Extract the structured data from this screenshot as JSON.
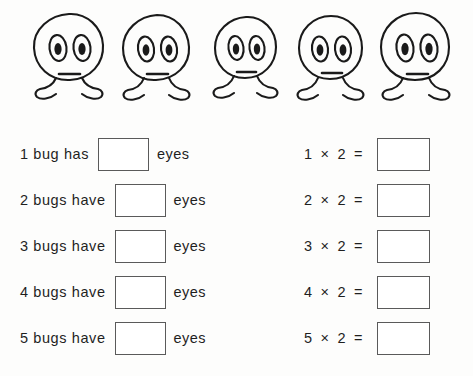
{
  "worksheet": {
    "illustration": {
      "creature_name": "bug",
      "count": 5,
      "eyes_per_creature": 2,
      "bugs": [
        {
          "label": "bug-1"
        },
        {
          "label": "bug-2"
        },
        {
          "label": "bug-3"
        },
        {
          "label": "bug-4"
        },
        {
          "label": "bug-5"
        }
      ]
    },
    "rows": [
      {
        "sentence": "1 bug has",
        "answer": "",
        "unit": "eyes",
        "equation": "1  ×  2  =",
        "equation_answer": ""
      },
      {
        "sentence": "2 bugs have",
        "answer": "",
        "unit": "eyes",
        "equation": "2  ×  2  =",
        "equation_answer": ""
      },
      {
        "sentence": "3 bugs have",
        "answer": "",
        "unit": "eyes",
        "equation": "3  ×  2  =",
        "equation_answer": ""
      },
      {
        "sentence": "4 bugs have",
        "answer": "",
        "unit": "eyes",
        "equation": "4  ×  2  =",
        "equation_answer": ""
      },
      {
        "sentence": "5 bugs have",
        "answer": "",
        "unit": "eyes",
        "equation": "5  ×  2  =",
        "equation_answer": ""
      }
    ],
    "colors": {
      "ink": "#1a1a1a",
      "box_border": "#5a5a5a",
      "paper": "#fdfdfc"
    }
  }
}
